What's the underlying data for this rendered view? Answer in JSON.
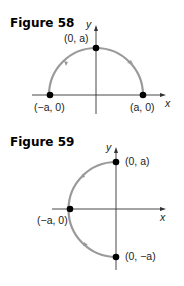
{
  "figures": [
    {
      "title": "Figure 58",
      "axis_x_label": "x",
      "axis_y_label": "y",
      "points": [
        {
          "label": "(0, a)"
        },
        {
          "label": "(−a, 0)"
        },
        {
          "label": "(a, 0)"
        }
      ],
      "curve": "upper semicircle from (a, 0) counterclockwise to (−a, 0)",
      "curve_color": "#9a9a9a"
    },
    {
      "title": "Figure 59",
      "axis_x_label": "x",
      "axis_y_label": "y",
      "points": [
        {
          "label": "(0, a)"
        },
        {
          "label": "(−a, 0)"
        },
        {
          "label": "(0, −a)"
        }
      ],
      "curve": "left semicircle from (0, a) counterclockwise to (0, −a)",
      "curve_color": "#9a9a9a"
    }
  ]
}
